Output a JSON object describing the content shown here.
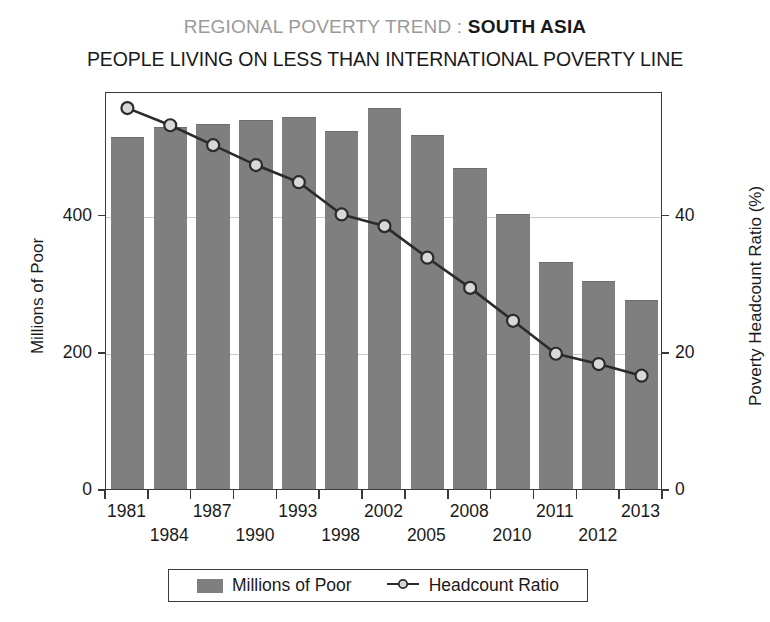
{
  "title": {
    "prefix": "REGIONAL POVERTY TREND : ",
    "region": "SOUTH ASIA",
    "subtitle": "PEOPLE LIVING ON LESS THAN INTERNATIONAL POVERTY LINE"
  },
  "legend": {
    "bar_label": "Millions of Poor",
    "line_label": "Headcount Ratio"
  },
  "colors": {
    "bar_fill": "#7f7f7f",
    "line": "#2b2b2b",
    "marker_fill": "#d8d8d8",
    "frame": "#3a3a3a",
    "grid": "#c9c9c9",
    "title_prefix": "#9a9a9a"
  },
  "chart_data": {
    "type": "bar",
    "title": "REGIONAL POVERTY TREND : SOUTH ASIA",
    "subtitle": "PEOPLE LIVING ON LESS THAN INTERNATIONAL POVERTY LINE",
    "xlabel": "",
    "ylabel": "Millions of Poor",
    "y2label": "Poverty Headcount Ratio (%)",
    "categories": [
      "1981",
      "1984",
      "1987",
      "1990",
      "1993",
      "1998",
      "2002",
      "2005",
      "2008",
      "2010",
      "2011",
      "2012",
      "2013"
    ],
    "ylim": [
      0,
      580
    ],
    "yticks": [
      0,
      200,
      400
    ],
    "y2lim": [
      0,
      58
    ],
    "y2ticks": [
      0,
      20,
      40
    ],
    "grid": true,
    "legend_position": "bottom",
    "series": [
      {
        "name": "Millions of Poor",
        "type": "bar",
        "axis": "left",
        "units": "millions",
        "values": [
          511,
          526,
          530,
          536,
          541,
          520,
          554,
          514,
          467,
          400,
          330,
          302,
          274
        ]
      },
      {
        "name": "Headcount Ratio",
        "type": "line",
        "axis": "right",
        "units": "percent",
        "values": [
          55.8,
          53.3,
          50.4,
          47.5,
          45.0,
          40.3,
          38.6,
          34.0,
          29.6,
          24.8,
          20.0,
          18.5,
          16.8
        ]
      }
    ]
  },
  "axes": {
    "left_title": "Millions of Poor",
    "right_title": "Poverty Headcount Ratio (%)"
  }
}
